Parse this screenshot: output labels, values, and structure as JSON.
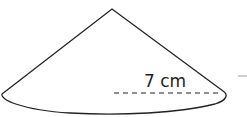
{
  "figure": {
    "shape": "cone",
    "radius_label": "7 cm",
    "colors": {
      "stroke": "#222222",
      "background": "#ffffff",
      "mark": "#bdbdbd"
    }
  }
}
